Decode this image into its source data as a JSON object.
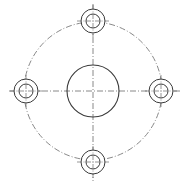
{
  "diagram": {
    "width": 188,
    "height": 187,
    "colors": {
      "background": "#ffffff",
      "outline": "#3a3a3a",
      "centerline": "#6a6a6a"
    },
    "center": {
      "x": 93,
      "y": 91
    },
    "central_bore": {
      "r": 26
    },
    "bolt_circle": {
      "r": 69
    },
    "bolt_holes": [
      {
        "name": "top",
        "cx": 93,
        "cy": 21,
        "outer_r": 12,
        "inner_r": 7
      },
      {
        "name": "left",
        "cx": 26,
        "cy": 91,
        "outer_r": 12,
        "inner_r": 7
      },
      {
        "name": "right",
        "cx": 161,
        "cy": 91,
        "outer_r": 12,
        "inner_r": 7
      },
      {
        "name": "bottom",
        "cx": 93,
        "cy": 162,
        "outer_r": 12,
        "inner_r": 7
      }
    ],
    "centerlines": {
      "horizontal": {
        "x1": 9,
        "x2": 181,
        "y": 91
      },
      "vertical": {
        "y1": 4,
        "y2": 181,
        "x": 93
      }
    }
  }
}
